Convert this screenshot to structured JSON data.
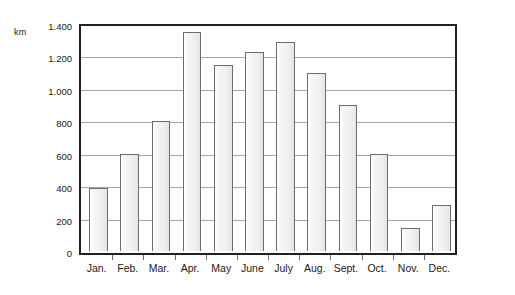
{
  "chart_data": {
    "type": "bar",
    "title": "",
    "subtitle": "",
    "xlabel": "",
    "ylabel": "km",
    "unit_label": "km",
    "categories": [
      "Jan.",
      "Feb.",
      "Mar.",
      "Apr.",
      "May",
      "June",
      "July",
      "Aug.",
      "Sept.",
      "Oct.",
      "Nov.",
      "Dec."
    ],
    "values": [
      390,
      600,
      800,
      1350,
      1150,
      1225,
      1290,
      1100,
      900,
      600,
      145,
      285
    ],
    "series": [
      {
        "name": "km",
        "values": [
          390,
          600,
          800,
          1350,
          1150,
          1225,
          1290,
          1100,
          900,
          600,
          145,
          285
        ]
      }
    ],
    "ylim": [
      0,
      1400
    ],
    "ytick_values": [
      0,
      200,
      400,
      600,
      800,
      1000,
      1200,
      1400
    ],
    "ytick_labels": [
      "0",
      "200",
      "400",
      "600",
      "800",
      "1.000",
      "1.200",
      "1.400"
    ],
    "grid": true,
    "grid_axis": "y",
    "legend": false,
    "legend_position": "none",
    "annotations": []
  },
  "style": {
    "bar_fill": "#efefef",
    "bar_border": "#6d6d6d",
    "grid_color": "#a7a7a7",
    "axis_color": "#231f20",
    "background": "#ffffff",
    "text_color": "#1a1a1a"
  }
}
